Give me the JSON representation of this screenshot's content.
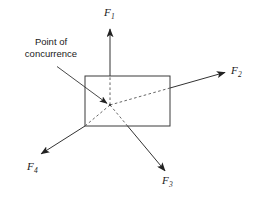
{
  "figure": {
    "background_color": "#ffffff",
    "stroke_color": "#333333",
    "text_color": "#1a1a1a",
    "width": 256,
    "height": 201
  },
  "annotation": {
    "line1": "Point of",
    "line2": "concurrence",
    "full_text": "Point of concurrence"
  },
  "forces": [
    {
      "id": "F1",
      "label_base": "F",
      "label_sub": "1",
      "direction": "up",
      "origin": [
        110,
        105
      ],
      "tip": [
        110,
        28
      ],
      "dashed_inside_body": true
    },
    {
      "id": "F2",
      "label_base": "F",
      "label_sub": "2",
      "direction": "up-right",
      "origin": [
        110,
        105
      ],
      "tip": [
        226,
        72
      ],
      "dashed_inside_body": true
    },
    {
      "id": "F3",
      "label_base": "F",
      "label_sub": "3",
      "direction": "down-right",
      "origin": [
        110,
        105
      ],
      "tip": [
        166,
        172
      ],
      "dashed_inside_body": true
    },
    {
      "id": "F4",
      "label_base": "F",
      "label_sub": "4",
      "direction": "down-left",
      "origin": [
        110,
        105
      ],
      "tip": [
        40,
        155
      ],
      "dashed_inside_body": true
    }
  ],
  "body": {
    "shape": "rectangle",
    "x": 85,
    "y": 76,
    "width": 85,
    "height": 50
  },
  "concurrence_point": {
    "x": 110,
    "y": 105
  },
  "leader_line": {
    "from": [
      57,
      67
    ],
    "to": [
      108,
      104
    ]
  }
}
